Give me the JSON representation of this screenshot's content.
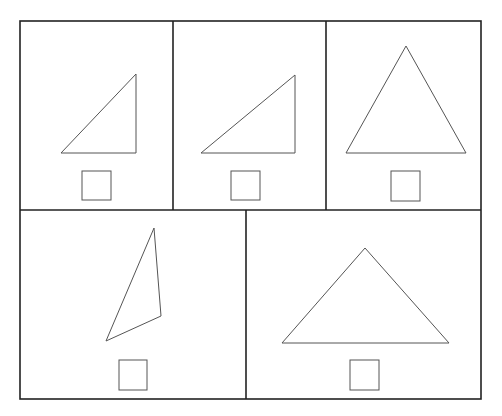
{
  "colors": {
    "frame": "#222222",
    "shape": "#555555",
    "background": "#ffffff"
  },
  "frame": {
    "x": 20,
    "y": 21,
    "w": 461,
    "h": 378
  },
  "dividers": [
    {
      "x1": 20,
      "y1": 210,
      "x2": 481,
      "y2": 210
    },
    {
      "x1": 173,
      "y1": 21,
      "x2": 173,
      "y2": 210
    },
    {
      "x1": 326,
      "y1": 21,
      "x2": 326,
      "y2": 210
    },
    {
      "x1": 246,
      "y1": 210,
      "x2": 246,
      "y2": 399
    }
  ],
  "panels": [
    {
      "id": "panel-1",
      "shape": "right-triangle",
      "triangle": [
        [
          61,
          153
        ],
        [
          136,
          74
        ],
        [
          136,
          153
        ]
      ],
      "square": {
        "x": 82,
        "y": 171,
        "w": 29,
        "h": 29
      }
    },
    {
      "id": "panel-2",
      "shape": "right-triangle",
      "triangle": [
        [
          201,
          153
        ],
        [
          295,
          75
        ],
        [
          295,
          153
        ]
      ],
      "square": {
        "x": 231,
        "y": 171,
        "w": 29,
        "h": 29
      }
    },
    {
      "id": "panel-3",
      "shape": "equilateral-triangle",
      "triangle": [
        [
          346,
          153
        ],
        [
          406,
          46
        ],
        [
          466,
          153
        ]
      ],
      "square": {
        "x": 391,
        "y": 171,
        "w": 29,
        "h": 30
      }
    },
    {
      "id": "panel-4",
      "shape": "scalene-triangle",
      "triangle": [
        [
          106,
          341
        ],
        [
          154,
          228
        ],
        [
          161,
          316
        ]
      ],
      "square": {
        "x": 119,
        "y": 360,
        "w": 28,
        "h": 30
      }
    },
    {
      "id": "panel-5",
      "shape": "obtuse-isosceles-triangle",
      "triangle": [
        [
          282,
          343
        ],
        [
          365,
          248
        ],
        [
          449,
          343
        ]
      ],
      "square": {
        "x": 350,
        "y": 360,
        "w": 29,
        "h": 30
      }
    }
  ]
}
